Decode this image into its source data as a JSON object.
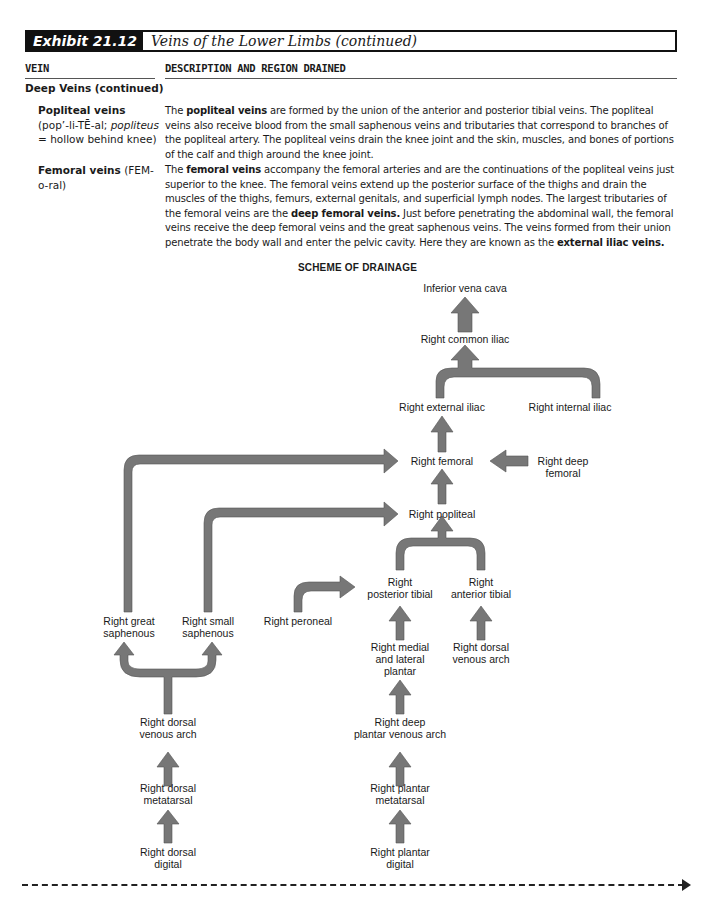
{
  "exhibit": {
    "number": "Exhibit 21.12",
    "title": "Veins of the Lower Limbs (continued)"
  },
  "columns": {
    "vein": "VEIN",
    "description": "DESCRIPTION AND REGION DRAINED"
  },
  "section": "Deep Veins (continued)",
  "entries": [
    {
      "name": "Popliteal veins",
      "pronunciation_pre": "(pop’-li-TĒ-al; ",
      "etymology_term": "popliteus",
      "pronunciation_post": " = hollow behind knee)",
      "description_parts": [
        {
          "text": "The ",
          "bold": false
        },
        {
          "text": "popliteal veins",
          "bold": true
        },
        {
          "text": " are formed by the union of the anterior and posterior tibial veins. The popliteal veins also receive blood from the small saphenous veins and tributaries that correspond to branches of the popliteal artery. The popliteal veins drain the knee joint and the skin, muscles, and bones of portions of the calf and thigh around the knee joint.",
          "bold": false
        }
      ]
    },
    {
      "name": "Femoral veins",
      "pronunciation_pre": " (FEM-o-ral)",
      "etymology_term": "",
      "pronunciation_post": "",
      "description_parts": [
        {
          "text": "The ",
          "bold": false
        },
        {
          "text": "femoral veins",
          "bold": true
        },
        {
          "text": " accompany the femoral arteries and are the continuations of the popliteal veins just superior to the knee. The femoral veins extend up the posterior surface of the thighs and drain the muscles of the thighs, femurs, external genitals, and superficial lymph nodes. The largest tributaries of the femoral veins are the ",
          "bold": false
        },
        {
          "text": "deep femoral veins.",
          "bold": true
        },
        {
          "text": " Just before penetrating the abdominal wall, the femoral veins receive the deep femoral veins and the great saphenous veins. The veins formed from their union penetrate the body wall and enter the pelvic cavity. Here they are known as the ",
          "bold": false
        },
        {
          "text": "external iliac veins.",
          "bold": true
        }
      ]
    }
  ],
  "scheme": {
    "title": "SCHEME OF DRAINAGE",
    "arrow_color": "#777777",
    "nodes": {
      "ivc": "Inferior vena cava",
      "common_iliac": "Right common iliac",
      "external_iliac": "Right external iliac",
      "internal_iliac": "Right internal iliac",
      "femoral": "Right femoral",
      "deep_femoral_1": "Right deep",
      "deep_femoral_2": "femoral",
      "popliteal": "Right popliteal",
      "posterior_tibial_1": "Right",
      "posterior_tibial_2": "posterior tibial",
      "anterior_tibial_1": "Right",
      "anterior_tibial_2": "anterior tibial",
      "peroneal": "Right peroneal",
      "great_saphenous_1": "Right great",
      "great_saphenous_2": "saphenous",
      "small_saphenous_1": "Right small",
      "small_saphenous_2": "saphenous",
      "medial_lateral_plantar_1": "Right medial",
      "medial_lateral_plantar_2": "and lateral",
      "medial_lateral_plantar_3": "plantar",
      "dorsal_venous_arch_r_1": "Right dorsal",
      "dorsal_venous_arch_r_2": "venous arch",
      "dorsal_venous_arch_l_1": "Right dorsal",
      "dorsal_venous_arch_l_2": "venous arch",
      "deep_plantar_arch_1": "Right deep",
      "deep_plantar_arch_2": "plantar venous arch",
      "dorsal_metatarsal_1": "Right dorsal",
      "dorsal_metatarsal_2": "metatarsal",
      "plantar_metatarsal_1": "Right plantar",
      "plantar_metatarsal_2": "metatarsal",
      "dorsal_digital_1": "Right dorsal",
      "dorsal_digital_2": "digital",
      "plantar_digital_1": "Right plantar",
      "plantar_digital_2": "digital"
    }
  }
}
